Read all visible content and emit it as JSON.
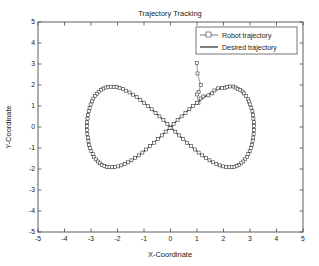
{
  "chart_data": {
    "type": "line",
    "title": "Trajectory Tracking",
    "xlabel": "X-Coordinate",
    "ylabel": "Y-Coordinate",
    "xlim": [
      -5,
      5
    ],
    "ylim": [
      -5,
      5
    ],
    "xticks": [
      "-5",
      "-4",
      "-3",
      "-2",
      "-1",
      "0",
      "1",
      "2",
      "3",
      "4",
      "5"
    ],
    "yticks": [
      "-5",
      "-4",
      "-3",
      "-2",
      "-1",
      "0",
      "1",
      "2",
      "3",
      "4",
      "5"
    ],
    "xtick_values": [
      -5,
      -4,
      -3,
      -2,
      -1,
      0,
      1,
      2,
      3,
      4,
      5
    ],
    "ytick_values": [
      -5,
      -4,
      -3,
      -2,
      -1,
      0,
      1,
      2,
      3,
      4,
      5
    ],
    "grid": false,
    "legend_position": "upper-right",
    "curve_shape": "figure-eight lemniscate",
    "x_amplitude": 3.15,
    "y_amplitude": 1.92,
    "series": [
      {
        "name": "Robot trajectory",
        "marker": "square-open",
        "linestyle": "solid",
        "color": "#555555",
        "transient_points": [
          [
            1.0,
            3.05
          ],
          [
            1.02,
            2.55
          ],
          [
            1.14,
            2.0
          ],
          [
            1.06,
            1.66
          ],
          [
            1.0,
            1.55
          ]
        ]
      },
      {
        "name": "Desired trajectory",
        "marker": "none",
        "linestyle": "solid",
        "color": "#2b2b2b"
      }
    ]
  },
  "legend": {
    "entries": [
      {
        "label": "Robot trajectory"
      },
      {
        "label": "Desired trajectory"
      }
    ]
  }
}
